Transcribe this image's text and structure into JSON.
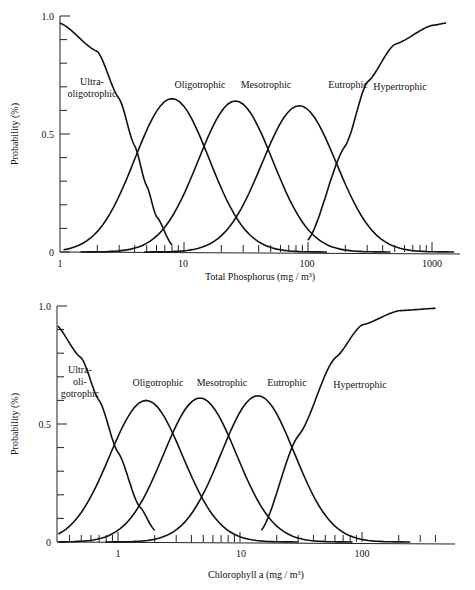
{
  "chart_data": [
    {
      "type": "line",
      "title": "",
      "xlabel": "Total Phosphorus (mg / m³)",
      "ylabel": "Probability (%)",
      "xscale": "log",
      "xlim": [
        1,
        2000
      ],
      "ylim": [
        0,
        1.0
      ],
      "yticks": [
        "0",
        "0.5",
        "1.0"
      ],
      "xticks": [
        "1",
        "10",
        "100",
        "1000"
      ],
      "legend": "inline labels",
      "series": [
        {
          "name": "Ultra-oligotrophic",
          "label_lines": [
            "Ultra-",
            "oligotrophic"
          ],
          "x": [
            1,
            2,
            3,
            4,
            5,
            6,
            8
          ],
          "y": [
            0.97,
            0.85,
            0.65,
            0.45,
            0.28,
            0.15,
            0.03
          ]
        },
        {
          "name": "Oligotrophic",
          "label_lines": [
            "Oligotrophic"
          ],
          "peak_x": 8.0,
          "peak_y": 0.65
        },
        {
          "name": "Mesotrophic",
          "label_lines": [
            "Mesotrophic"
          ],
          "peak_x": 26,
          "peak_y": 0.64
        },
        {
          "name": "Eutrophic",
          "label_lines": [
            "Eutrophic"
          ],
          "peak_x": 85,
          "peak_y": 0.62
        },
        {
          "name": "Hypertrophic",
          "label_lines": [
            "Hypertrophic"
          ],
          "x": [
            100,
            200,
            300,
            500,
            1000,
            1300
          ],
          "y": [
            0.05,
            0.45,
            0.72,
            0.88,
            0.96,
            0.97
          ]
        }
      ]
    },
    {
      "type": "line",
      "title": "",
      "xlabel": "Chlorophyll a (mg / m³)",
      "ylabel": "Probability (%)",
      "xscale": "log",
      "xlim": [
        0.3,
        700
      ],
      "ylim": [
        0,
        1.0
      ],
      "yticks": [
        "0",
        "0.5",
        "1.0"
      ],
      "xticks": [
        "1",
        "10",
        "100"
      ],
      "legend": "inline labels",
      "series": [
        {
          "name": "Ultra-oligotrophic",
          "label_lines": [
            "Ultra-",
            "oli-",
            "gotrophic"
          ],
          "x": [
            0.3,
            0.5,
            0.7,
            1.0,
            1.5,
            2.0
          ],
          "y": [
            0.93,
            0.78,
            0.6,
            0.38,
            0.15,
            0.05
          ]
        },
        {
          "name": "Oligotrophic",
          "label_lines": [
            "Oligotrophic"
          ],
          "peak_x": 1.7,
          "peak_y": 0.6
        },
        {
          "name": "Mesotrophic",
          "label_lines": [
            "Mesotrophic"
          ],
          "peak_x": 4.7,
          "peak_y": 0.61
        },
        {
          "name": "Eutrophic",
          "label_lines": [
            "Eutrophic"
          ],
          "peak_x": 14,
          "peak_y": 0.62
        },
        {
          "name": "Hypertrophic",
          "label_lines": [
            "Hypertrophic"
          ],
          "x": [
            15,
            30,
            60,
            100,
            200,
            400
          ],
          "y": [
            0.05,
            0.45,
            0.78,
            0.92,
            0.98,
            0.99
          ]
        }
      ]
    }
  ]
}
